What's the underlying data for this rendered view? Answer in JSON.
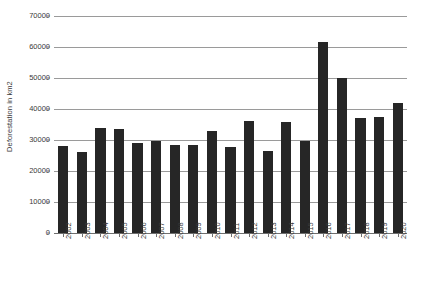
{
  "chart_data": {
    "type": "bar",
    "title": "",
    "xlabel": "",
    "ylabel": "Deforestation in km2",
    "ylim": [
      0,
      70000
    ],
    "ytick_step": 10000,
    "yticks": [
      "0",
      "10000",
      "20000",
      "30000",
      "40000",
      "50000",
      "60000",
      "70000"
    ],
    "grid": true,
    "legend": "none",
    "bar_color": "#262626",
    "grid_color": "#9a9a9a",
    "categories": [
      "2002",
      "2003",
      "2004",
      "2005",
      "2006",
      "2007",
      "2008",
      "2009",
      "2010",
      "2011",
      "2012",
      "2013",
      "2014",
      "2015",
      "2016",
      "2017",
      "2018",
      "2019",
      "2020"
    ],
    "values": [
      28000,
      26000,
      34000,
      33600,
      29000,
      29800,
      28500,
      28400,
      33000,
      27700,
      36000,
      26500,
      35900,
      29800,
      61500,
      50000,
      37200,
      37500,
      42000
    ]
  }
}
